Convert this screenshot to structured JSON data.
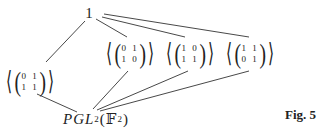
{
  "diagram": {
    "type": "subgroup-lattice",
    "top": {
      "label": "1"
    },
    "middle": [
      {
        "id": "g1",
        "rows": [
          "0 1",
          "1 1"
        ]
      },
      {
        "id": "g2",
        "rows": [
          "0 1",
          "1 0"
        ]
      },
      {
        "id": "g3",
        "rows": [
          "1 0",
          "1 1"
        ]
      },
      {
        "id": "g4",
        "rows": [
          "1 1",
          "0 1"
        ]
      }
    ],
    "bottom": {
      "prefix": "PGL",
      "subscript": "2",
      "field_open": "(",
      "field": "𝔽",
      "field_sub": "2",
      "field_close": ")"
    },
    "caption": "Fig. 5",
    "angle_open": "⟨",
    "angle_close": "⟩",
    "paren_open": "(",
    "paren_close": ")",
    "edges": [
      [
        "1",
        "g1"
      ],
      [
        "1",
        "g2"
      ],
      [
        "1",
        "g3"
      ],
      [
        "1",
        "g4"
      ],
      [
        "g1",
        "PGL"
      ],
      [
        "g2",
        "PGL"
      ],
      [
        "g3",
        "PGL"
      ],
      [
        "g4",
        "PGL"
      ]
    ],
    "line_color": "#333333"
  }
}
